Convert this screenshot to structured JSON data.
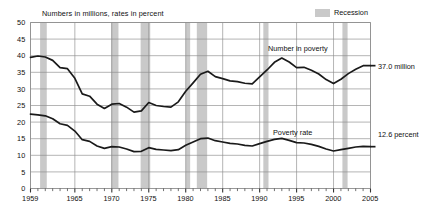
{
  "chart_data": {
    "type": "line",
    "title": "",
    "subtitle": "",
    "axis_note": "Numbers in millions, rates in percent",
    "xlabel": "",
    "ylabel": "",
    "xlim": [
      1959,
      2005
    ],
    "ylim": [
      0,
      50
    ],
    "ytick_step": 5,
    "grid": true,
    "legend_position": "top-right",
    "yticks": [
      "0",
      "5",
      "10",
      "15",
      "20",
      "25",
      "30",
      "35",
      "40",
      "45",
      "50"
    ],
    "xticks": [
      "1959",
      "1965",
      "1970",
      "1975",
      "1980",
      "1985",
      "1990",
      "1995",
      "2000",
      "2005"
    ],
    "xtick_values": [
      1959,
      1965,
      1970,
      1975,
      1980,
      1985,
      1990,
      1995,
      2000,
      2005
    ],
    "minor_tick_interval": 1,
    "x": [
      1959,
      1960,
      1961,
      1962,
      1963,
      1964,
      1965,
      1966,
      1967,
      1968,
      1969,
      1970,
      1971,
      1972,
      1973,
      1974,
      1975,
      1976,
      1977,
      1978,
      1979,
      1980,
      1981,
      1982,
      1983,
      1984,
      1985,
      1986,
      1987,
      1988,
      1989,
      1990,
      1991,
      1992,
      1993,
      1994,
      1995,
      1996,
      1997,
      1998,
      1999,
      2000,
      2001,
      2002,
      2003,
      2004,
      2005
    ],
    "series": [
      {
        "name": "Number in poverty",
        "units": "millions",
        "label": "Number in poverty",
        "end_label": "37.0 million",
        "end_value": 37.0,
        "values": [
          39.5,
          39.9,
          39.6,
          38.6,
          36.4,
          36.1,
          33.2,
          28.5,
          27.8,
          25.4,
          24.1,
          25.4,
          25.6,
          24.5,
          23.0,
          23.4,
          25.9,
          25.0,
          24.7,
          24.5,
          26.1,
          29.3,
          31.8,
          34.4,
          35.3,
          33.7,
          33.1,
          32.4,
          32.2,
          31.7,
          31.5,
          33.6,
          35.7,
          38.0,
          39.3,
          38.1,
          36.4,
          36.5,
          35.6,
          34.5,
          32.8,
          31.6,
          32.9,
          34.6,
          35.9,
          37.0,
          37.0
        ]
      },
      {
        "name": "Poverty rate",
        "units": "percent",
        "label": "Poverty rate",
        "end_label": "12.6 percent",
        "end_value": 12.6,
        "values": [
          22.4,
          22.2,
          21.9,
          21.0,
          19.5,
          19.0,
          17.3,
          14.7,
          14.2,
          12.8,
          12.1,
          12.6,
          12.5,
          11.9,
          11.1,
          11.2,
          12.3,
          11.8,
          11.6,
          11.4,
          11.7,
          13.0,
          14.0,
          15.0,
          15.2,
          14.4,
          14.0,
          13.6,
          13.4,
          13.0,
          12.8,
          13.5,
          14.2,
          14.8,
          15.1,
          14.5,
          13.8,
          13.7,
          13.3,
          12.7,
          11.9,
          11.3,
          11.7,
          12.1,
          12.5,
          12.7,
          12.6
        ]
      }
    ],
    "shaded_regions": {
      "label": "Recession",
      "color": "#c9c9c9",
      "periods": [
        {
          "start": 1960.3,
          "end": 1961.2
        },
        {
          "start": 1969.9,
          "end": 1970.9
        },
        {
          "start": 1973.9,
          "end": 1975.2
        },
        {
          "start": 1980.0,
          "end": 1980.6
        },
        {
          "start": 1981.5,
          "end": 1982.9
        },
        {
          "start": 1990.5,
          "end": 1991.2
        },
        {
          "start": 2001.2,
          "end": 2001.9
        }
      ]
    }
  }
}
